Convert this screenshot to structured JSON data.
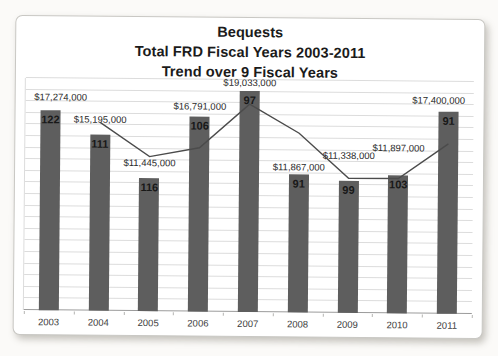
{
  "page": {
    "background_color": "#fbfaf8",
    "card_color": "#ffffff"
  },
  "chart_data": {
    "type": "bar",
    "title": "Bequests Total FRD Fiscal Years 2003-2011 Trend over 9 Fiscal Years",
    "title_lines": [
      "Bequests",
      "Total FRD Fiscal Years 2003-2011",
      "Trend over 9 Fiscal Years"
    ],
    "categories": [
      "2003",
      "2004",
      "2005",
      "2006",
      "2007",
      "2008",
      "2009",
      "2010",
      "2011"
    ],
    "series": [
      {
        "name": "total-bequest-dollars",
        "type": "bar",
        "values": [
          17274000,
          15195000,
          11445000,
          16791000,
          19033000,
          11867000,
          11338000,
          11897000,
          17400000
        ],
        "data_labels": [
          "$17,274,000",
          "$15,195,000",
          "$11,445,000",
          "$16,791,000",
          "$19,033,000",
          "$11,867,000",
          "$11,338,000",
          "$11,897,000",
          "$17,400,000"
        ],
        "color": "#5e5e5e"
      },
      {
        "name": "bequest-count-labels-inside-bars",
        "type": "label",
        "values": [
          122,
          111,
          116,
          106,
          97,
          91,
          99,
          103,
          91
        ]
      },
      {
        "name": "two-period-moving-average-trend-line",
        "type": "line",
        "values": [
          null,
          16234500,
          13320000,
          14118000,
          17912000,
          15450000,
          11602500,
          11617500,
          14648500
        ],
        "color": "#4b4b4b"
      }
    ],
    "xlabel": "",
    "ylabel": "",
    "ylim": [
      0,
      20000000
    ],
    "gridline_step": 1000000,
    "grid": true,
    "legend_position": "none",
    "y_axis_tick_labels_visible": false,
    "label_lift_px": [
      8,
      10,
      10,
      5,
      3,
      2,
      20,
      22,
      6
    ]
  }
}
